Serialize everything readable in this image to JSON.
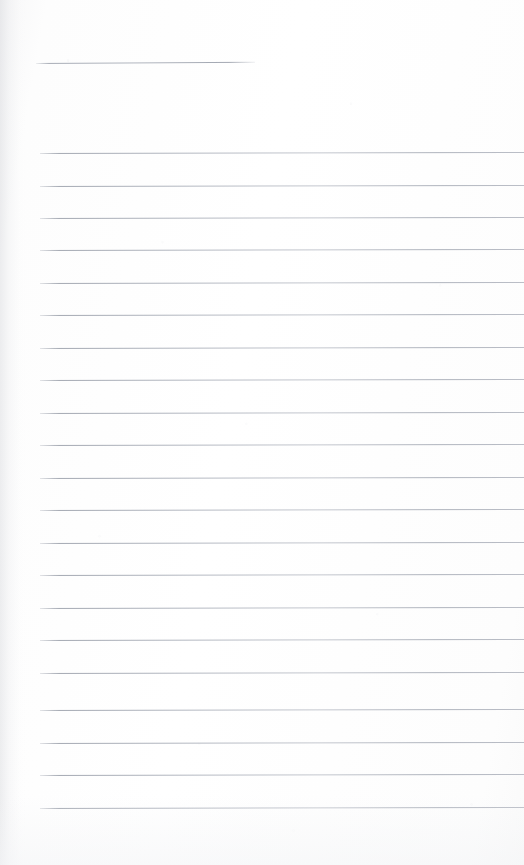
{
  "page": {
    "kind": "scanned-blank-ruled-page",
    "width": 524,
    "height": 865,
    "background_color": "#fdfdfd",
    "text_content": "",
    "note": "blank lined writing page, no handwriting or printed text present"
  },
  "colors": {
    "paper": "#fdfdfd",
    "rule_line": "#b9bdc5",
    "rule_line_dark": "#a0a5af",
    "edge_shadow": "#c4c6cc"
  },
  "header_rule": {
    "label": "",
    "x": 36,
    "y": 63,
    "width": 219,
    "thickness": 1
  },
  "ruling": {
    "first_line_y": 153,
    "line_spacing": 32.4,
    "line_count": 21,
    "left_margin_x": 40,
    "right_edge_x": 524,
    "thickness": 1,
    "lines": [
      {
        "index": 1,
        "y": 153,
        "x": 40,
        "width": 484
      },
      {
        "index": 2,
        "y": 186,
        "x": 40,
        "width": 484
      },
      {
        "index": 3,
        "y": 218,
        "x": 40,
        "width": 484
      },
      {
        "index": 4,
        "y": 250,
        "x": 40,
        "width": 484
      },
      {
        "index": 5,
        "y": 283,
        "x": 40,
        "width": 484
      },
      {
        "index": 6,
        "y": 315,
        "x": 40,
        "width": 484
      },
      {
        "index": 7,
        "y": 348,
        "x": 40,
        "width": 484
      },
      {
        "index": 8,
        "y": 380,
        "x": 40,
        "width": 484
      },
      {
        "index": 9,
        "y": 413,
        "x": 40,
        "width": 484
      },
      {
        "index": 10,
        "y": 445,
        "x": 40,
        "width": 484
      },
      {
        "index": 11,
        "y": 478,
        "x": 40,
        "width": 484
      },
      {
        "index": 12,
        "y": 510,
        "x": 40,
        "width": 484
      },
      {
        "index": 13,
        "y": 543,
        "x": 40,
        "width": 484
      },
      {
        "index": 14,
        "y": 575,
        "x": 40,
        "width": 484
      },
      {
        "index": 15,
        "y": 608,
        "x": 40,
        "width": 484
      },
      {
        "index": 16,
        "y": 640,
        "x": 40,
        "width": 484
      },
      {
        "index": 17,
        "y": 673,
        "x": 40,
        "width": 484
      },
      {
        "index": 18,
        "y": 710,
        "x": 40,
        "width": 484
      },
      {
        "index": 19,
        "y": 743,
        "x": 40,
        "width": 484
      },
      {
        "index": 20,
        "y": 775,
        "x": 40,
        "width": 484
      },
      {
        "index": 21,
        "y": 808,
        "x": 40,
        "width": 484
      }
    ]
  }
}
